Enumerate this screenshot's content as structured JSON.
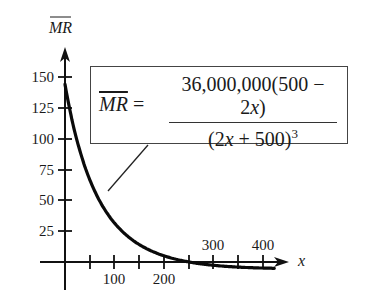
{
  "chart_data": {
    "type": "line",
    "title": "",
    "xlabel": "x",
    "ylabel": "MR (overline)",
    "formula": {
      "lhs": "MR",
      "equals": "=",
      "numerator_prefix": "36,000,000(500 − 2",
      "numerator_var": "x",
      "numerator_suffix": ")",
      "denominator_prefix": "(2",
      "denominator_var": "x",
      "denominator_suffix": " + 500)",
      "denominator_exponent": "3"
    },
    "x_ticks": [
      50,
      100,
      150,
      200,
      250,
      300,
      350,
      400
    ],
    "x_tick_labels": [
      "100",
      "200",
      "300",
      "400"
    ],
    "y_ticks": [
      25,
      50,
      75,
      100,
      125,
      150
    ],
    "y_tick_labels": [
      "25",
      "50",
      "75",
      "100",
      "125",
      "150"
    ],
    "xlim": [
      0,
      450
    ],
    "ylim": [
      -10,
      170
    ],
    "grid": false,
    "legend": "none",
    "series": [
      {
        "name": "MR",
        "x": [
          0,
          10,
          20,
          30,
          40,
          50,
          60,
          80,
          100,
          125,
          150,
          175,
          200,
          225,
          250,
          275,
          300,
          350,
          400,
          420
        ],
        "values": [
          144.0,
          123.1,
          105.6,
          90.9,
          78.4,
          67.8,
          58.8,
          44.3,
          33.6,
          23.0,
          15.6,
          10.2,
          6.3,
          3.0,
          0.0,
          -1.3,
          -2.6,
          -4.0,
          -4.9,
          -5.1
        ]
      }
    ]
  },
  "labels": {
    "y_axis": "MR",
    "x_axis": "x",
    "y150": "150",
    "y125": "125",
    "y100": "100",
    "y75": "75",
    "y50": "50",
    "y25": "25",
    "x100": "100",
    "x200": "200",
    "x300": "300",
    "x400": "400"
  }
}
